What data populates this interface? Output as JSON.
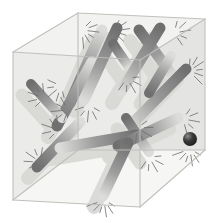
{
  "figure": {
    "title": "Rods randomly packed inside a transparent cube",
    "caption_sliver": "",
    "background_color": "#ffffff",
    "cube": {
      "face_fill_top": "#f2f2f0",
      "face_fill_left": "#ebebe9",
      "face_fill_right": "#e4e4e2",
      "face_fill_bottom": "#f6f6f4",
      "edge_color": "#bdbdb9",
      "edge_width": 1.1,
      "vertices": {
        "top_back": [
          78,
          13
        ],
        "top_left": [
          13,
          52
        ],
        "top_right": [
          205,
          19
        ],
        "top_front": [
          140,
          60
        ],
        "bottom_back": [
          78,
          150
        ],
        "bottom_left": [
          13,
          200
        ],
        "bottom_right": [
          205,
          150
        ],
        "bottom_front": [
          140,
          207
        ]
      }
    },
    "rod_style": {
      "cap": "round",
      "gradient_dark": "#6f6f6f",
      "gradient_mid": "#9d9d9d",
      "gradient_light": "#dcdcda",
      "shadow_color": "#d9d9d6",
      "outline_color": "#8a8a8a"
    },
    "rods": [
      {
        "id": "rod-1",
        "x1": 70,
        "y1": 103,
        "x2": 102,
        "y2": 30,
        "width": 11,
        "dark_end": "start"
      },
      {
        "id": "rod-2",
        "x1": 57,
        "y1": 126,
        "x2": 92,
        "y2": 62,
        "width": 11,
        "dark_end": "start"
      },
      {
        "id": "rod-3",
        "x1": 31,
        "y1": 84,
        "x2": 62,
        "y2": 118,
        "width": 10,
        "dark_end": "start"
      },
      {
        "id": "rod-4",
        "x1": 37,
        "y1": 167,
        "x2": 80,
        "y2": 122,
        "width": 11,
        "dark_end": "start"
      },
      {
        "id": "rod-5",
        "x1": 117,
        "y1": 28,
        "x2": 84,
        "y2": 100,
        "width": 11,
        "dark_end": "start"
      },
      {
        "id": "rod-6",
        "x1": 129,
        "y1": 67,
        "x2": 113,
        "y2": 44,
        "width": 10,
        "dark_end": "end"
      },
      {
        "id": "rod-7",
        "x1": 139,
        "y1": 30,
        "x2": 172,
        "y2": 75,
        "width": 11,
        "dark_end": "start"
      },
      {
        "id": "rod-8",
        "x1": 160,
        "y1": 28,
        "x2": 121,
        "y2": 92,
        "width": 11,
        "dark_end": "start"
      },
      {
        "id": "rod-9",
        "x1": 186,
        "y1": 69,
        "x2": 129,
        "y2": 127,
        "width": 11,
        "dark_end": "start"
      },
      {
        "id": "rod-10",
        "x1": 126,
        "y1": 118,
        "x2": 149,
        "y2": 152,
        "width": 10,
        "dark_end": "start"
      },
      {
        "id": "rod-11",
        "x1": 60,
        "y1": 148,
        "x2": 136,
        "y2": 135,
        "width": 11,
        "dark_end": "end"
      },
      {
        "id": "rod-12",
        "x1": 178,
        "y1": 118,
        "x2": 118,
        "y2": 146,
        "width": 11,
        "dark_end": "end"
      },
      {
        "id": "rod-13",
        "x1": 103,
        "y1": 196,
        "x2": 128,
        "y2": 143,
        "width": 11,
        "dark_end": "end"
      },
      {
        "id": "rod-14",
        "x1": 149,
        "y1": 93,
        "x2": 171,
        "y2": 56,
        "width": 10,
        "dark_end": "start"
      }
    ],
    "sphere": {
      "id": "dark-sphere",
      "cx": 190,
      "cy": 139,
      "r": 7,
      "fill": "#1d1d1d",
      "highlight": "#8d8d8d"
    },
    "spark_clusters": [
      {
        "cx": 82,
        "cy": 30,
        "angle": 20,
        "rays": 6
      },
      {
        "cx": 113,
        "cy": 31,
        "angle": 5,
        "rays": 6
      },
      {
        "cx": 174,
        "cy": 33,
        "angle": -10,
        "rays": 5
      },
      {
        "cx": 61,
        "cy": 86,
        "angle": 140,
        "rays": 5
      },
      {
        "cx": 127,
        "cy": 78,
        "angle": 60,
        "rays": 5
      },
      {
        "cx": 189,
        "cy": 71,
        "angle": -20,
        "rays": 6
      },
      {
        "cx": 44,
        "cy": 98,
        "angle": 200,
        "rays": 5
      },
      {
        "cx": 68,
        "cy": 110,
        "angle": 175,
        "rays": 5
      },
      {
        "cx": 89,
        "cy": 105,
        "angle": 95,
        "rays": 5
      },
      {
        "cx": 137,
        "cy": 128,
        "angle": 30,
        "rays": 5
      },
      {
        "cx": 58,
        "cy": 130,
        "angle": 200,
        "rays": 5
      },
      {
        "cx": 40,
        "cy": 162,
        "angle": 215,
        "rays": 5
      },
      {
        "cx": 183,
        "cy": 119,
        "angle": 10,
        "rays": 5
      },
      {
        "cx": 190,
        "cy": 149,
        "angle": 95,
        "rays": 6
      },
      {
        "cx": 149,
        "cy": 157,
        "angle": 60,
        "rays": 5
      },
      {
        "cx": 104,
        "cy": 200,
        "angle": 95,
        "rays": 6
      }
    ]
  }
}
